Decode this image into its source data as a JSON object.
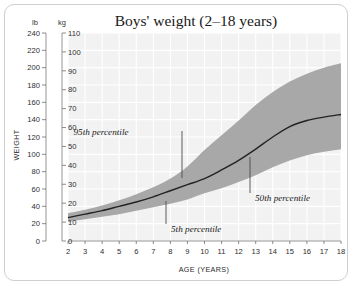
{
  "chart_data": {
    "type": "area",
    "title": "Boys' weight (2–18 years)",
    "xlabel": "AGE (YEARS)",
    "ylabel": "WEIGHT",
    "grid": true,
    "legend_position": "none",
    "x": [
      2,
      3,
      4,
      5,
      6,
      7,
      8,
      9,
      10,
      11,
      12,
      13,
      14,
      15,
      16,
      17,
      18
    ],
    "xtick_labels": [
      "2",
      "3",
      "4",
      "5",
      "6",
      "7",
      "8",
      "9",
      "10",
      "11",
      "12",
      "13",
      "14",
      "15",
      "16",
      "17",
      "18"
    ],
    "xlim": [
      2,
      18
    ],
    "y_axes": [
      {
        "unit_label": "lb",
        "side": "outer-left",
        "ylim": [
          0,
          240
        ],
        "ticks": [
          0,
          20,
          40,
          60,
          80,
          100,
          120,
          140,
          160,
          180,
          200,
          220,
          240
        ],
        "tick_labels": [
          "0",
          "20",
          "40",
          "60",
          "80",
          "100",
          "120",
          "140",
          "160",
          "180",
          "200",
          "220",
          "240"
        ]
      },
      {
        "unit_label": "kg",
        "side": "inner-left",
        "ylim": [
          0,
          110
        ],
        "ticks": [
          0,
          10,
          20,
          30,
          40,
          50,
          60,
          70,
          80,
          90,
          100,
          110
        ],
        "tick_labels": [
          "0",
          "10",
          "20",
          "30",
          "40",
          "50",
          "60",
          "70",
          "80",
          "90",
          "100",
          "110"
        ]
      }
    ],
    "series": [
      {
        "name": "95th percentile",
        "role": "band-upper",
        "unit": "lb",
        "values": [
          32,
          36,
          41,
          47,
          54,
          62,
          72,
          86,
          105,
          122,
          139,
          157,
          172,
          184,
          193,
          200,
          205
        ]
      },
      {
        "name": "50th percentile",
        "role": "median-line",
        "unit": "lb",
        "values": [
          27,
          31,
          35,
          40,
          45,
          51,
          58,
          65,
          72,
          82,
          93,
          106,
          120,
          132,
          139,
          143,
          146
        ]
      },
      {
        "name": "5th percentile",
        "role": "band-lower",
        "unit": "lb",
        "values": [
          22,
          25,
          28,
          31,
          35,
          39,
          43,
          48,
          55,
          61,
          68,
          76,
          85,
          93,
          99,
          103,
          106
        ]
      }
    ],
    "annotations": [
      {
        "text": "95th percentile",
        "points_to_series": "95th percentile",
        "target_age": 10,
        "target_value_lb": 105,
        "label_x_px": 96,
        "label_y_px": 130,
        "leader_x_px": 177,
        "leader_y_top_px": 126,
        "leader_y_bottom_px": 173
      },
      {
        "text": "5th percentile",
        "points_to_series": "5th percentile",
        "target_age": 9,
        "target_value_lb": 48,
        "label_x_px": 166,
        "label_y_px": 227,
        "leader_x_px": 161,
        "leader_y_top_px": 196,
        "leader_y_bottom_px": 219
      },
      {
        "text": "50th percentile",
        "points_to_series": "50th percentile",
        "target_age": 14,
        "target_value_lb": 120,
        "label_x_px": 250,
        "label_y_px": 196,
        "leader_x_px": 245,
        "leader_y_top_px": 152,
        "leader_y_bottom_px": 188
      }
    ],
    "colors": {
      "plot_background": "#f2f2f2",
      "gridline": "#ffffff",
      "band_fill": "#a8a8a8",
      "median_line": "#232323",
      "text": "#1a1a1a",
      "frame_border": "#cfcfcf"
    }
  }
}
